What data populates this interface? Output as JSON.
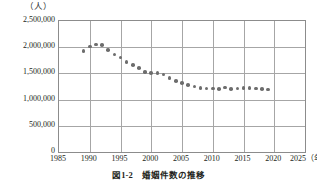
{
  "figure": {
    "unit_label": "（人）",
    "caption": "図1-2　婚姻件数の推移"
  },
  "chart_data": {
    "type": "line",
    "title": "",
    "subtitle": "",
    "xlabel": "（年）",
    "ylabel": "（人）",
    "unit": "人",
    "grid": true,
    "legend": "none",
    "marker": "filled-circle",
    "marker_color": "#6d6d6d",
    "xlim": [
      1985,
      2025
    ],
    "ylim": [
      0,
      2500000
    ],
    "xticks": [
      1985,
      1990,
      1995,
      2000,
      2005,
      2010,
      2015,
      2020,
      2025
    ],
    "xtick_labels": [
      "1985",
      "1990",
      "1995",
      "2000",
      "2005",
      "2010",
      "2015",
      "2020",
      "2025"
    ],
    "x_axis_suffix": "（年）",
    "yticks": [
      0,
      500000,
      1000000,
      1500000,
      2000000,
      2500000
    ],
    "ytick_labels": [
      "0",
      "500,000",
      "1,000,000",
      "1,500,000",
      "2,000,000",
      "2,500,000"
    ],
    "x": [
      1989,
      1990,
      1991,
      1992,
      1993,
      1994,
      1995,
      1996,
      1997,
      1998,
      1999,
      2000,
      2001,
      2002,
      2003,
      2004,
      2005,
      2006,
      2007,
      2008,
      2009,
      2010,
      2011,
      2012,
      2013,
      2014,
      2015,
      2016,
      2017,
      2018,
      2019
    ],
    "values": [
      1930000,
      2010000,
      2050000,
      2040000,
      1950000,
      1860000,
      1800000,
      1720000,
      1660000,
      1600000,
      1530000,
      1510000,
      1510000,
      1480000,
      1410000,
      1360000,
      1320000,
      1280000,
      1250000,
      1220000,
      1210000,
      1210000,
      1200000,
      1230000,
      1200000,
      1210000,
      1220000,
      1220000,
      1210000,
      1200000,
      1190000
    ]
  }
}
